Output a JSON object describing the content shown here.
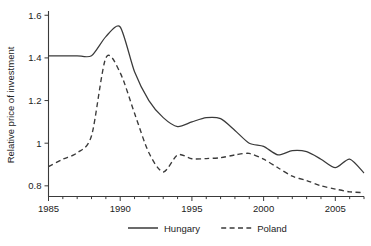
{
  "chart_data": {
    "type": "line",
    "title": "",
    "xlabel": "",
    "ylabel": "Relative price of investment",
    "xlim": [
      1985,
      2007
    ],
    "ylim": [
      0.75,
      1.62
    ],
    "grid": false,
    "legend_position": "bottom",
    "x_ticks": [
      "1985",
      "1990",
      "1995",
      "2000",
      "2005"
    ],
    "x_tick_values": [
      1985,
      1990,
      1995,
      2000,
      2005
    ],
    "y_ticks": [
      "0.8",
      "1",
      "1.2",
      "1.4",
      "1.6"
    ],
    "y_tick_values": [
      0.8,
      1.0,
      1.2,
      1.4,
      1.6
    ],
    "x": [
      1985,
      1986,
      1987,
      1988,
      1989,
      1990,
      1991,
      1992,
      1993,
      1994,
      1995,
      1996,
      1997,
      1998,
      1999,
      2000,
      2001,
      2002,
      2003,
      2004,
      2005,
      2006,
      2007
    ],
    "series": [
      {
        "name": "Hungary",
        "style": "solid",
        "color": "#3a3a3a",
        "values": [
          1.41,
          1.41,
          1.41,
          1.41,
          1.5,
          1.545,
          1.335,
          1.2,
          1.12,
          1.078,
          1.1,
          1.12,
          1.115,
          1.06,
          1.0,
          0.985,
          0.945,
          0.965,
          0.96,
          0.925,
          0.885,
          0.925,
          0.86
        ]
      },
      {
        "name": "Poland",
        "style": "dashed",
        "color": "#3a3a3a",
        "values": [
          0.89,
          0.925,
          0.955,
          1.035,
          1.4,
          1.33,
          1.14,
          0.955,
          0.865,
          0.945,
          0.927,
          0.928,
          0.932,
          0.945,
          0.952,
          0.925,
          0.885,
          0.845,
          0.825,
          0.8,
          0.785,
          0.772,
          0.768
        ]
      }
    ]
  },
  "legend": {
    "items": [
      {
        "label": "Hungary",
        "style": "solid"
      },
      {
        "label": "Poland",
        "style": "dashed"
      }
    ]
  },
  "axes": {
    "y_title": "Relative price of investment"
  }
}
